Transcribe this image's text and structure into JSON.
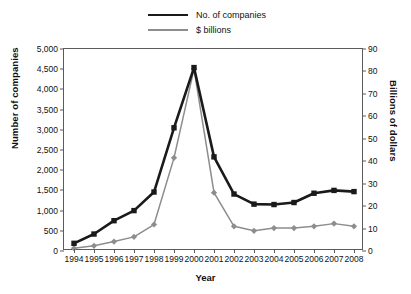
{
  "chart_data": {
    "type": "line",
    "title": "",
    "xlabel": "Year",
    "ylabel": "Number of companies",
    "ylabel_secondary": "Billions of dollars",
    "grid": false,
    "legend_position": "top-center",
    "categories": [
      "1994",
      "1995",
      "1996",
      "1997",
      "1998",
      "1999",
      "2000",
      "2001",
      "2002",
      "2003",
      "2004",
      "2005",
      "2006",
      "2007",
      "2008"
    ],
    "ylim": [
      0,
      5000
    ],
    "ytick_step": 500,
    "ylim_secondary": [
      0,
      90
    ],
    "ytick_step_secondary": 10,
    "ytick_labels": [
      "0",
      "500",
      "1,000",
      "1,500",
      "2,000",
      "2,500",
      "3,000",
      "3,500",
      "4,000",
      "4,500",
      "5,000"
    ],
    "ytick_values": [
      0,
      500,
      1000,
      1500,
      2000,
      2500,
      3000,
      3500,
      4000,
      4500,
      5000
    ],
    "ytick_labels_secondary": [
      "0",
      "10",
      "20",
      "30",
      "40",
      "50",
      "60",
      "70",
      "80",
      "90"
    ],
    "ytick_values_secondary": [
      0,
      10,
      20,
      30,
      40,
      50,
      60,
      70,
      80,
      90
    ],
    "series": [
      {
        "name": "No. of companies",
        "axis": "left",
        "color": "#1a1a1a",
        "marker": "square",
        "values": [
          190,
          420,
          750,
          1000,
          1460,
          3050,
          4540,
          2330,
          1410,
          1160,
          1150,
          1200,
          1430,
          1500,
          1470
        ]
      },
      {
        "name": "$ billions",
        "axis": "right",
        "color": "#8d8d8d",
        "marker": "diamond",
        "values": [
          1.2,
          2.3,
          4.2,
          6.3,
          11.8,
          41.5,
          81.0,
          26.0,
          11.0,
          9.0,
          10.2,
          10.2,
          11.0,
          12.2,
          11.0
        ]
      }
    ]
  },
  "legend": {
    "items": [
      {
        "label": "No. of companies",
        "color": "#1a1a1a",
        "marker": "square"
      },
      {
        "label": "$ billions",
        "color": "#8d8d8d",
        "marker": "diamond"
      }
    ]
  },
  "axis_titles": {
    "left": "Number of companies",
    "right": "Billions of dollars",
    "bottom": "Year"
  },
  "colors": {
    "series_primary": "#1a1a1a",
    "series_secondary": "#8d8d8d",
    "axis": "#5b5b5b",
    "background": "#ffffff"
  }
}
